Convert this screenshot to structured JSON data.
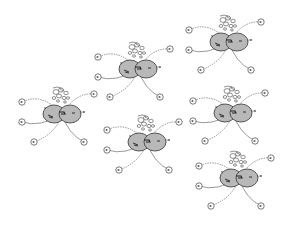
{
  "figure": {
    "type": "sketch-diagram",
    "width": 292,
    "height": 227,
    "background": "#ffffff",
    "colors": {
      "body_fill": "#b8b8b8",
      "body_stroke": "#333333",
      "line": "#555555",
      "node_fill": "#ffffff"
    },
    "clusters": [
      {
        "id": "cluster-1",
        "cx": 138,
        "cy": 69
      },
      {
        "id": "cluster-2",
        "cx": 229,
        "cy": 42
      },
      {
        "id": "cluster-3",
        "cx": 62,
        "cy": 114
      },
      {
        "id": "cluster-4",
        "cx": 147,
        "cy": 142
      },
      {
        "id": "cluster-5",
        "cx": 233,
        "cy": 113
      },
      {
        "id": "cluster-6",
        "cx": 239,
        "cy": 178
      }
    ]
  }
}
